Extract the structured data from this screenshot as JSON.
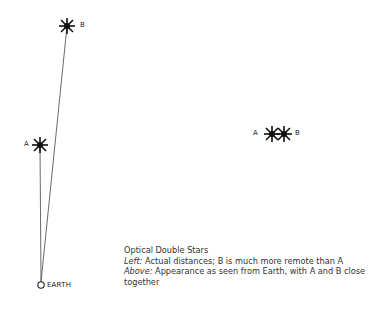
{
  "diagram": {
    "left": {
      "stars": [
        {
          "label": "A",
          "x": 40,
          "y": 145
        },
        {
          "label": "B",
          "x": 67,
          "y": 26
        }
      ],
      "observer": {
        "label": "EARTH",
        "x": 41,
        "y": 285
      }
    },
    "right": {
      "stars": [
        {
          "label": "A",
          "x": 273,
          "y": 134
        },
        {
          "label": "B",
          "x": 285,
          "y": 134
        }
      ]
    }
  },
  "caption": {
    "title": "Optical Double Stars",
    "line1_prefix": "Left:",
    "line1_text": " Actual distances; B is much more remote than A",
    "line2_prefix": "Above:",
    "line2_text": " Appearance as seen from Earth, with A and B close together"
  }
}
